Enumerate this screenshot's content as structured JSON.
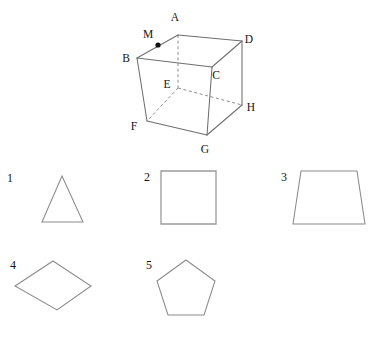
{
  "page": {
    "background_color": "#ffffff",
    "line_color": "#6e6e6e",
    "hidden_line_color": "#8d8d8d",
    "shape_line_color": "#8a8a8a",
    "marker_color": "#111111",
    "text_color": "#141414"
  },
  "cube": {
    "name": "labelled-cube-diagram",
    "vertex_labels": {
      "A": "A",
      "B": "B",
      "C": "C",
      "D": "D",
      "E": "E",
      "F": "F",
      "G": "G",
      "H": "H",
      "M": "M"
    },
    "vertices": {
      "A": [
        178,
        35
      ],
      "B": [
        137,
        58
      ],
      "C": [
        212,
        67
      ],
      "D": [
        242,
        41
      ],
      "E": [
        178,
        88
      ],
      "F": [
        147,
        121
      ],
      "G": [
        207,
        135
      ],
      "H": [
        242,
        105
      ]
    },
    "marker_point": {
      "label": "M",
      "on_edge": "B-A",
      "position": [
        158,
        45
      ]
    },
    "solid_edges": [
      [
        "B",
        "A"
      ],
      [
        "A",
        "D"
      ],
      [
        "B",
        "C"
      ],
      [
        "C",
        "D"
      ],
      [
        "B",
        "F"
      ],
      [
        "C",
        "G"
      ],
      [
        "D",
        "H"
      ],
      [
        "F",
        "G"
      ],
      [
        "G",
        "H"
      ]
    ],
    "hidden_edges": [
      [
        "A",
        "E"
      ],
      [
        "E",
        "F"
      ],
      [
        "E",
        "H"
      ]
    ],
    "label_positions": {
      "A": [
        175,
        21
      ],
      "B": [
        126,
        62
      ],
      "C": [
        214,
        79
      ],
      "D": [
        247,
        42
      ],
      "E": [
        167,
        88
      ],
      "F": [
        134,
        129
      ],
      "G": [
        203,
        152
      ],
      "H": [
        248,
        111
      ],
      "M": [
        148,
        38
      ]
    }
  },
  "shapes": [
    {
      "number": "1",
      "name": "triangle",
      "label_position": [
        7,
        182
      ],
      "points": "62,176 83,222 42,222"
    },
    {
      "number": "2",
      "name": "square",
      "label_position": [
        144,
        181
      ],
      "points": "161,171 216,171 216,224 161,224"
    },
    {
      "number": "3",
      "name": "trapezoid",
      "label_position": [
        281,
        181
      ],
      "points": "301,171 357,171 365,224 293,224"
    },
    {
      "number": "4",
      "name": "rhombus",
      "label_position": [
        10,
        268
      ],
      "points": "53,261 91,286 57,310 15,286"
    },
    {
      "number": "5",
      "name": "pentagon",
      "label_position": [
        146,
        268
      ],
      "points": "186,260 215,281 204,315 168,315 157,281"
    }
  ]
}
